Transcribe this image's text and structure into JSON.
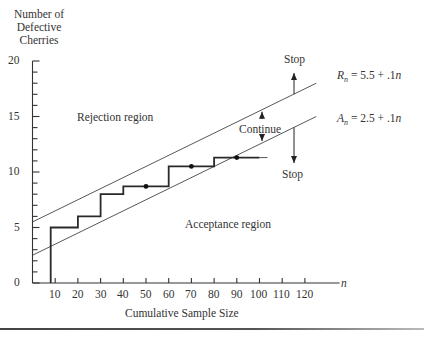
{
  "chart_data": {
    "type": "line",
    "title": "",
    "xlabel": "Cumulative Sample Size",
    "ylabel": "Number of Defective Cherries",
    "x_axis_var": "n",
    "xlim": [
      0,
      130
    ],
    "ylim": [
      0,
      20
    ],
    "x_ticks": [
      10,
      20,
      30,
      40,
      50,
      60,
      70,
      80,
      90,
      100,
      110,
      120
    ],
    "y_ticks": [
      0,
      5,
      10,
      15,
      20
    ],
    "y_minor_step": 1,
    "grid": false,
    "series": [
      {
        "name": "R_n = 5.5 + .1n",
        "kind": "line",
        "intercept": 5.5,
        "slope": 0.1,
        "x_range": [
          0,
          125
        ]
      },
      {
        "name": "A_n = 2.5 + .1n",
        "kind": "line",
        "intercept": 2.5,
        "slope": 0.1,
        "x_range": [
          0,
          125
        ]
      },
      {
        "name": "Cumulative defectives",
        "kind": "step",
        "x": [
          8,
          8,
          20,
          20,
          30,
          30,
          40,
          40,
          60,
          60,
          80,
          80,
          100
        ],
        "y": [
          0,
          5,
          5,
          6,
          6,
          8,
          8,
          8.7,
          8.7,
          10.5,
          10.5,
          11.3,
          11.3
        ]
      },
      {
        "name": "Markers",
        "kind": "scatter",
        "x": [
          50,
          70,
          90
        ],
        "y": [
          8.7,
          10.5,
          11.3
        ]
      }
    ],
    "annotations": [
      {
        "text": "Rejection region",
        "x": 28,
        "y": 14.2
      },
      {
        "text": "Acceptance region",
        "x": 72,
        "y": 5.2
      },
      {
        "text": "Continue",
        "x": 104,
        "y": 11.7
      },
      {
        "text": "Stop",
        "x": 110,
        "y": 18.5,
        "arrow": "up"
      },
      {
        "text": "Stop",
        "x": 110,
        "y": 6.5,
        "arrow": "down"
      }
    ]
  },
  "labels": {
    "ylabel_line1": "Number of",
    "ylabel_line2": "Defective",
    "ylabel_line3": "Cherries",
    "xlabel": "Cumulative Sample Size",
    "x_var": "n",
    "rejection": "Rejection region",
    "acceptance": "Acceptance region",
    "continue": "Continue",
    "stop_top": "Stop",
    "stop_bottom": "Stop",
    "rn_sym": "R",
    "rn_sub": "n",
    "rn_eq": " = 5.5 + .1",
    "rn_var": "n",
    "an_sym": "A",
    "an_sub": "n",
    "an_eq": " = 2.5 + .1",
    "an_var": "n"
  },
  "y_tick_labels": [
    "20",
    "15",
    "10",
    "5",
    "0"
  ],
  "x_tick_labels": [
    "10",
    "20",
    "30",
    "40",
    "50",
    "60",
    "70",
    "80",
    "90",
    "100",
    "110",
    "120"
  ]
}
